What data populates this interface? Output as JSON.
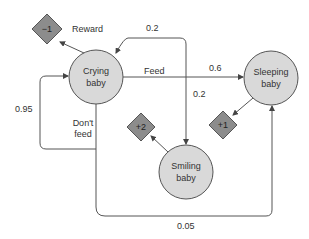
{
  "diagram": {
    "title": "",
    "states": [
      {
        "id": "crying",
        "line1": "Crying",
        "line2": "baby"
      },
      {
        "id": "sleeping",
        "line1": "Sleeping",
        "line2": "baby"
      },
      {
        "id": "smiling",
        "line1": "Smiling",
        "line2": "baby"
      }
    ],
    "rewards": [
      {
        "state": "crying",
        "value": "−1"
      },
      {
        "state": "smiling",
        "value": "+2"
      },
      {
        "state": "sleeping",
        "value": "+1"
      }
    ],
    "reward_label": "Reward",
    "actions": {
      "feed": "Feed",
      "dont_feed_line1": "Don't",
      "dont_feed_line2": "feed"
    },
    "transitions": [
      {
        "from": "crying",
        "action": "Feed",
        "to": "sleeping",
        "prob": "0.6"
      },
      {
        "from": "crying",
        "action": "Feed",
        "to": "crying",
        "prob": "0.2"
      },
      {
        "from": "crying",
        "action": "Feed",
        "to": "smiling",
        "prob": "0.2"
      },
      {
        "from": "crying",
        "action": "Don't feed",
        "to": "crying",
        "prob": "0.95"
      },
      {
        "from": "crying",
        "action": "Don't feed",
        "to": "sleeping",
        "prob": "0.05"
      }
    ],
    "colors": {
      "node_fill": "#d9d9d9",
      "reward_fill": "#8c8c8c",
      "stroke": "#555555"
    }
  }
}
